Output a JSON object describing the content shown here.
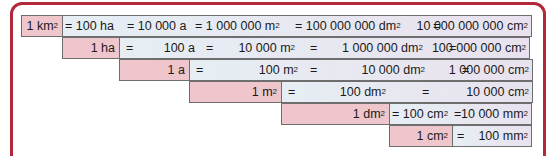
{
  "colors": {
    "frame": "#b3283a",
    "unit_fill": "#efc6cc",
    "row_fill": "#e6eef4",
    "border": "#6e6e6e"
  },
  "rows": [
    {
      "unit": "1 km",
      "parts": [
        "= 100 ha",
        "= 10 000 a",
        "= 1 000 000 m",
        "= 100 000 000 dm",
        "=",
        "10 000 000 000 cm"
      ]
    },
    {
      "unit": "1 ha",
      "parts": [
        "=",
        "100 a",
        "=",
        "10 000 m",
        "=",
        "1 000 000 dm",
        "=",
        "100 000 000 cm"
      ]
    },
    {
      "unit": "1 a",
      "parts": [
        "=",
        "100 m",
        "=",
        "10 000 dm",
        "=",
        "1 000 000 cm"
      ]
    },
    {
      "unit": "1 m",
      "parts": [
        "=",
        "100 dm",
        "=",
        "10 000 cm"
      ]
    },
    {
      "unit": "1 dm",
      "parts": [
        "= 100 cm",
        "=",
        "10 000 mm"
      ]
    },
    {
      "unit": "1 cm",
      "parts": [
        "=",
        "100 mm"
      ]
    }
  ],
  "superscript": "2"
}
